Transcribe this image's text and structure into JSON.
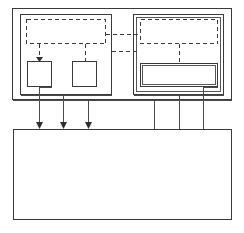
{
  "diagram": {
    "type": "block-diagram",
    "canvas": {
      "width": 244,
      "height": 233
    },
    "background_color": "#ffffff",
    "line_color": "#3a3a3a",
    "outer_container": {
      "name": "outer-container",
      "x": 12,
      "y": 8,
      "width": 220,
      "height": 92,
      "border_style": "solid"
    },
    "panels": [
      {
        "name": "left-panel",
        "x": 20,
        "y": 14,
        "width": 92,
        "height": 81,
        "border_style": "solid",
        "dashed_region": {
          "name": "left-dashed-region",
          "x": 26,
          "y": 19,
          "width": 80,
          "height": 25,
          "border_style": "dashed"
        },
        "blocks": [
          {
            "name": "left-block-one",
            "x": 27,
            "y": 61,
            "width": 25,
            "height": 26,
            "border_style": "solid"
          },
          {
            "name": "left-block-two",
            "x": 72,
            "y": 61,
            "width": 25,
            "height": 26,
            "border_style": "solid"
          }
        ]
      },
      {
        "name": "right-panel",
        "x": 133,
        "y": 14,
        "width": 91,
        "height": 81,
        "border_style": "solid",
        "dashed_region": {
          "name": "right-dashed-region",
          "x": 140,
          "y": 19,
          "width": 78,
          "height": 25,
          "border_style": "dashed"
        },
        "blocks": [
          {
            "name": "right-block-wide",
            "x": 140,
            "y": 63,
            "width": 78,
            "height": 24,
            "border_style": "solid"
          }
        ]
      }
    ],
    "bottom_box": {
      "name": "bottom-box",
      "x": 13,
      "y": 129,
      "width": 219,
      "height": 91,
      "border_style": "solid"
    },
    "dashed_links": [
      {
        "name": "inter-panel-link-upper",
        "from_x": 106,
        "to_x": 140,
        "y": 34
      },
      {
        "name": "inter-panel-link-lower",
        "from_x": 112,
        "to_x": 140,
        "y": 51
      },
      {
        "name": "left-stub-to-block-one",
        "x": 39,
        "from_y": 44,
        "to_y": 58
      },
      {
        "name": "left-stub-to-block-two",
        "x": 85,
        "from_y": 44,
        "to_y": 61
      },
      {
        "name": "right-stub-to-wide-block",
        "x": 179,
        "from_y": 44,
        "to_y": 63
      },
      {
        "name": "left-panel-edge-stub",
        "x": 112,
        "from_y": 34,
        "to_y": 51
      }
    ],
    "arrow_connectors": [
      {
        "name": "arrow-connector-one",
        "x": 39,
        "from_y": 87,
        "to_y": 129
      },
      {
        "name": "arrow-connector-two",
        "x": 63,
        "from_y": 95,
        "to_y": 129
      },
      {
        "name": "arrow-connector-three",
        "x": 88,
        "from_y": 100,
        "to_y": 129
      }
    ],
    "plain_connectors": [
      {
        "name": "plain-connector-one",
        "x": 154,
        "from_y": 100,
        "to_y": 129
      },
      {
        "name": "plain-connector-two",
        "x": 179,
        "from_y": 95,
        "to_y": 129
      },
      {
        "name": "plain-connector-three",
        "x": 203,
        "from_y": 87,
        "to_y": 129
      }
    ],
    "labels": {
      "outer_container": "",
      "left_panel": "",
      "right_panel": "",
      "bottom_box": "",
      "left_dashed_region": "",
      "right_dashed_region": "",
      "left_block_one": "",
      "left_block_two": "",
      "right_block_wide": ""
    }
  }
}
